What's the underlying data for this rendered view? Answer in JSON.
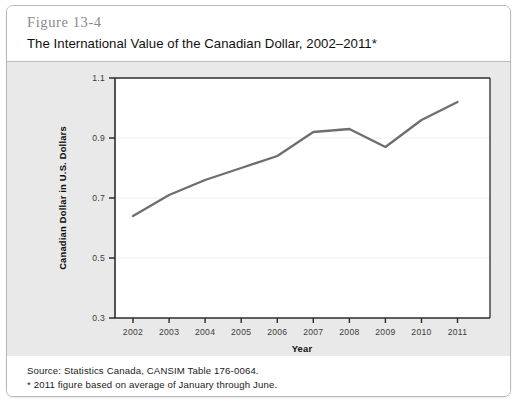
{
  "figure": {
    "number": "Figure 13-4",
    "title": "The International Value of the Canadian Dollar, 2002–2011*",
    "source_note": "Source: Statistics Canada, CANSIM Table 176-0064.",
    "footnote": "* 2011 figure based on average of January through June."
  },
  "colors": {
    "panel_background": "#e9e9e9",
    "plot_background": "#ffffff",
    "line": "#6e6e6e",
    "axis": "#2b2b2b",
    "gridline": "#efefef",
    "card_border": "#b9b9b9",
    "figure_number_text": "#8a8a8a"
  },
  "chart_data": {
    "type": "line",
    "title": "The International Value of the Canadian Dollar, 2002–2011*",
    "xlabel": "Year",
    "ylabel": "Canadian Dollar in U.S. Dollars",
    "x": [
      2002,
      2003,
      2004,
      2005,
      2006,
      2007,
      2008,
      2009,
      2010,
      2011
    ],
    "xtick_labels": [
      "2002",
      "2003",
      "2004",
      "2005",
      "2006",
      "2007",
      "2008",
      "2009",
      "2010",
      "2011"
    ],
    "values": [
      0.64,
      0.71,
      0.76,
      0.8,
      0.84,
      0.92,
      0.93,
      0.87,
      0.96,
      1.02
    ],
    "ylim": [
      0.3,
      1.1
    ],
    "ytick_labels": [
      "0.3",
      "0.5",
      "0.7",
      "0.9",
      "1.1"
    ],
    "yticks": [
      0.3,
      0.5,
      0.7,
      0.9,
      1.1
    ],
    "xlim": [
      2001.5,
      2011.9
    ],
    "grid": true,
    "legend": "none",
    "series": [
      {
        "name": "Canadian Dollar in U.S. Dollars",
        "values": [
          0.64,
          0.71,
          0.76,
          0.8,
          0.84,
          0.92,
          0.93,
          0.87,
          0.96,
          1.02
        ]
      }
    ]
  }
}
